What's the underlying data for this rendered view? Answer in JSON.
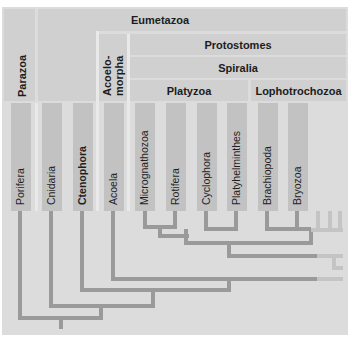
{
  "title_bands": {
    "eumetazoa": "Eumetazoa",
    "parazoa": "Parazoa",
    "acoelomorpha_line1": "Acoelo-",
    "acoelomorpha_line2": "morpha",
    "protostomes": "Protostomes",
    "spiralia": "Spiralia",
    "platyzoa": "Platyzoa",
    "lophotrochozoa": "Lophotrochozoa"
  },
  "taxa": [
    {
      "label": "Porifera",
      "bold": false
    },
    {
      "label": "Cnidaria",
      "bold": false
    },
    {
      "label": "Ctenophora",
      "bold": true
    },
    {
      "label": "Acoela",
      "bold": false
    },
    {
      "label": "Micrognathozoa",
      "bold": false
    },
    {
      "label": "Rotifera",
      "bold": false
    },
    {
      "label": "Cyclophora",
      "bold": false
    },
    {
      "label": "Platyhelminthes",
      "bold": false
    },
    {
      "label": "Brachiopoda",
      "bold": false
    },
    {
      "label": "Bryozoa",
      "bold": false
    }
  ],
  "colors": {
    "background": "#dcdcdc",
    "band": "#d0d0d0",
    "taxon_box": "#c2c2c2",
    "branch": "#9a9a9a",
    "faded_branch": "#c4c4c4",
    "divider": "#ffffff"
  }
}
